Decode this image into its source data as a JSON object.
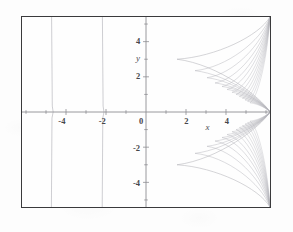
{
  "figure": {
    "background_color": "#fdfdfd",
    "frame_color": "#3a3a3c",
    "plot_background": "#fefefe"
  },
  "chart_data": {
    "type": "line",
    "title": "",
    "subtitle": "",
    "xlabel": "x",
    "ylabel": "y",
    "xlim": [
      -6.2,
      6.2
    ],
    "ylim": [
      -5.4,
      5.4
    ],
    "grid": false,
    "legend": false,
    "legend_position": "none",
    "axis_color": "#8d8d92",
    "curve_color": "#b4b4ba",
    "x_ticks": [
      -4,
      -2,
      0,
      2,
      4
    ],
    "x_tick_labels": [
      "-4",
      "-2",
      "0",
      "2",
      "4"
    ],
    "y_ticks": [
      4,
      2,
      0,
      -2,
      -4
    ],
    "y_tick_labels": [
      "4",
      "2",
      "0",
      "-2",
      "-4"
    ],
    "minor_tick_step": 1,
    "annotations": [
      {
        "text": "y",
        "x": -0.55,
        "y": 3.05
      },
      {
        "text": "x",
        "x": 2.9,
        "y": -0.85
      }
    ],
    "series": [
      {
        "name": "asymptote-left-outer",
        "kind": "vertical-asymptote",
        "x": -4.72,
        "y_range": [
          -5.4,
          5.4
        ]
      },
      {
        "name": "asymptote-left-inner",
        "kind": "vertical-asymptote",
        "x": -2.18,
        "y_range": [
          -5.4,
          5.4
        ]
      },
      {
        "name": "right-contour-family-upper",
        "kind": "nested-contours",
        "description": "family of nested curves opening leftward, converging toward right edge",
        "count": 13,
        "apex_x": [
          1.55,
          2.45,
          3.05,
          3.45,
          3.8,
          4.05,
          4.3,
          4.5,
          4.67,
          4.82,
          4.95,
          5.08,
          5.2
        ],
        "apex_y": [
          3.0,
          2.35,
          1.95,
          1.65,
          1.45,
          1.28,
          1.12,
          1.0,
          0.88,
          0.78,
          0.68,
          0.6,
          0.52
        ],
        "top_y": 5.4
      },
      {
        "name": "right-contour-family-lower",
        "kind": "nested-contours",
        "description": "mirror image of upper family below the x-axis",
        "count": 13,
        "apex_x": [
          1.55,
          2.45,
          3.05,
          3.45,
          3.8,
          4.05,
          4.3,
          4.5,
          4.67,
          4.82,
          4.95,
          5.08,
          5.2
        ],
        "apex_y": [
          -3.0,
          -2.35,
          -1.95,
          -1.65,
          -1.45,
          -1.28,
          -1.12,
          -1.0,
          -0.88,
          -0.78,
          -0.68,
          -0.6,
          -0.52
        ],
        "bottom_y": -5.4
      }
    ]
  }
}
